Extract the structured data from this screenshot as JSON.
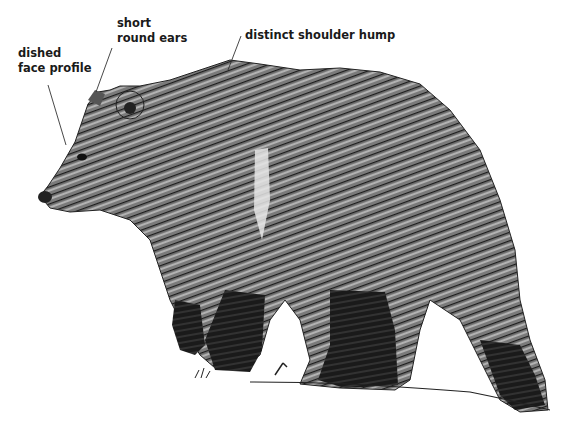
{
  "diagram": {
    "colors": {
      "ink": "#111111",
      "fur_mid": "#5a5a5a",
      "fur_light": "#9a9a9a",
      "background": "#ffffff"
    },
    "labels": [
      {
        "id": "ears",
        "lines": [
          "short",
          "round ears"
        ]
      },
      {
        "id": "face",
        "lines": [
          "dished",
          "face profile"
        ]
      },
      {
        "id": "hump",
        "lines": [
          "distinct shoulder hump"
        ]
      }
    ]
  }
}
